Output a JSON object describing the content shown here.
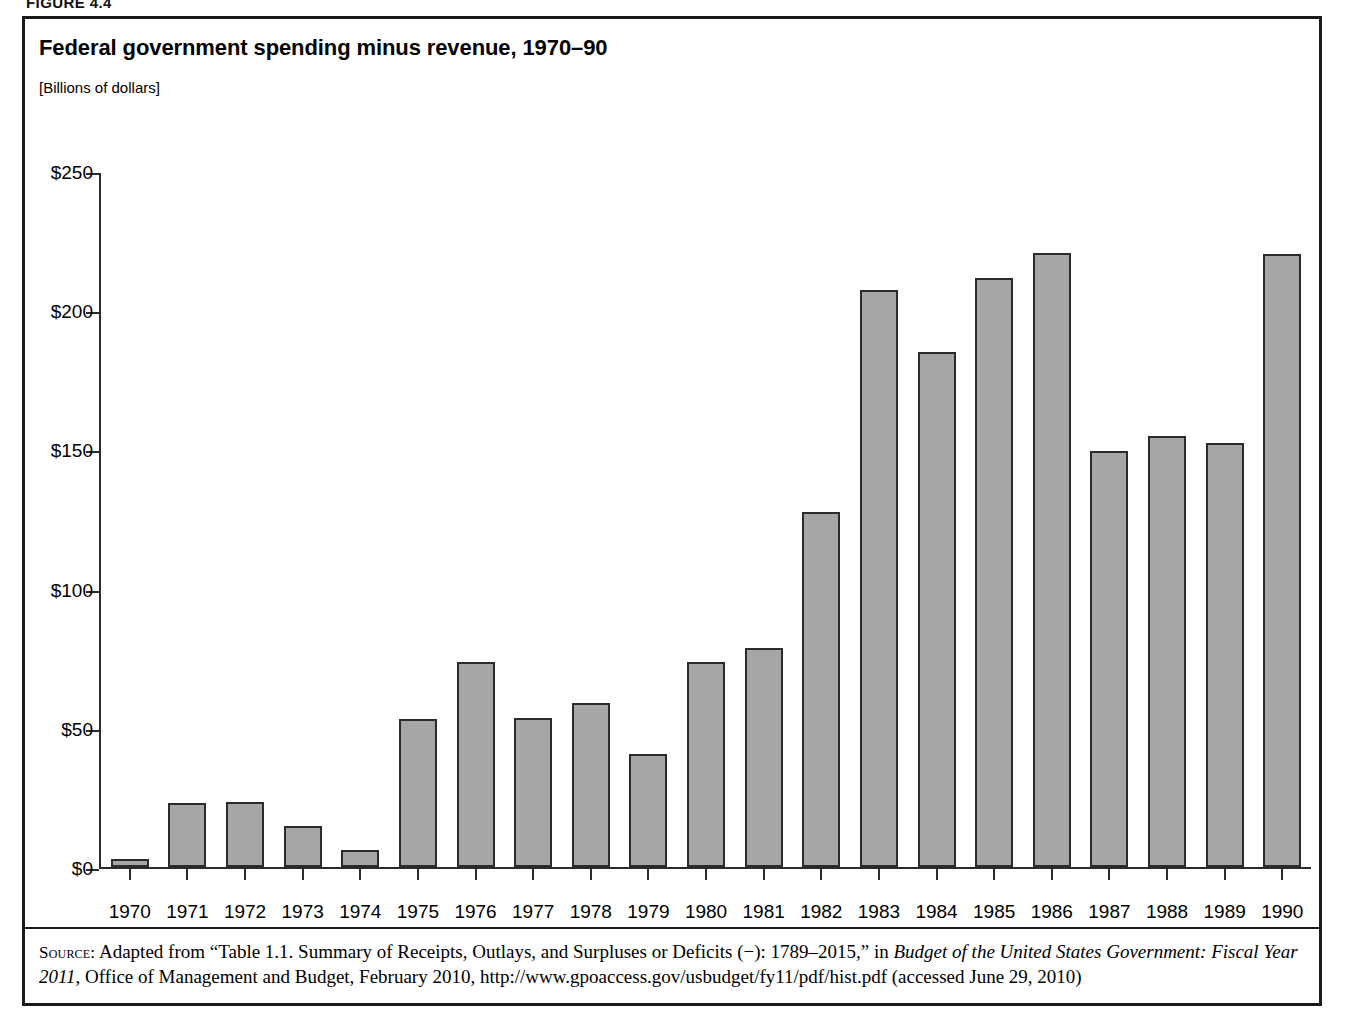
{
  "figure": {
    "label": "FIGURE 4.4",
    "title": "Federal government spending minus revenue, 1970–90",
    "subtitle": "[Billions of dollars]"
  },
  "source": {
    "kicker": "Source:",
    "text_part1": " Adapted from “Table 1.1. Summary of Receipts, Outlays, and Surpluses or Deficits (−): 1789–2015,” in ",
    "italic1": "Budget of the United States Government: Fiscal Year 2011",
    "text_part2": ", Office of Management and Budget, February 2010, http://www.gpoaccess.gov/usbudget/fy11/pdf/hist.pdf (accessed June 29, 2010)"
  },
  "chart_data": {
    "type": "bar",
    "title": "Federal government spending minus revenue, 1970–90",
    "subtitle": "[Billions of dollars]",
    "xlabel": "",
    "ylabel": "Billions of dollars",
    "ylim": [
      0,
      250
    ],
    "grid": false,
    "legend": null,
    "ytick_labels": [
      "$250",
      "$200",
      "$150",
      "$100",
      "$50",
      "$0"
    ],
    "ytick_values": [
      250,
      200,
      150,
      100,
      50,
      0
    ],
    "categories": [
      "1970",
      "1971",
      "1972",
      "1973",
      "1974",
      "1975",
      "1976",
      "1977",
      "1978",
      "1979",
      "1980",
      "1981",
      "1982",
      "1983",
      "1984",
      "1985",
      "1986",
      "1987",
      "1988",
      "1989",
      "1990"
    ],
    "values": [
      2.8,
      23.0,
      23.4,
      14.9,
      6.1,
      53.2,
      73.7,
      53.7,
      59.2,
      40.7,
      73.8,
      79.0,
      128.0,
      207.8,
      185.4,
      212.3,
      221.2,
      149.7,
      155.2,
      152.6,
      221.0
    ]
  }
}
